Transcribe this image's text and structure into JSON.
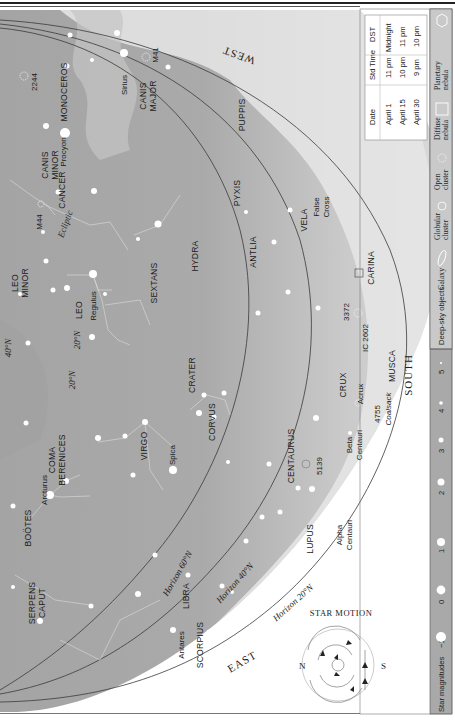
{
  "chart": {
    "title_motion": "STAR MOTION",
    "directions": {
      "west": "WEST",
      "east": "EAST",
      "south": "SOUTH",
      "n": "N",
      "s": "S"
    },
    "horizons": [
      "Horizon 60°N",
      "Horizon 40°N",
      "Horizon 20°N"
    ],
    "ecliptic": "Ecliptic",
    "latitudes": [
      "40°N",
      "20°N",
      "20°N"
    ],
    "constellations": [
      "MONOCEROS",
      "CANIS MINOR",
      "CANIS MAJOR",
      "PUPPIS",
      "CANCER",
      "PYXIS",
      "VELA",
      "LEO MINOR",
      "LEO",
      "SEXTANS",
      "HYDRA",
      "ANTLIA",
      "CARINA",
      "CRATER",
      "CORVUS",
      "CRUX",
      "MUSCA",
      "COMA BERENICES",
      "VIRGO",
      "CENTAURUS",
      "BOÖTES",
      "LUPUS",
      "SERPENS CAPUT",
      "LIBRA",
      "SCORPIUS"
    ],
    "stars": [
      "Sirius",
      "Procyon",
      "Regulus",
      "Arcturus",
      "Spica",
      "Acrux",
      "Beta Centauri",
      "Alpha Centauri",
      "Antares"
    ],
    "objects": [
      "2244",
      "M41",
      "M44",
      "3372",
      "IC 2602",
      "4755",
      "5139"
    ],
    "notes": [
      "False Cross",
      "Coalsack"
    ]
  },
  "legend": {
    "time_table": {
      "headers": [
        "Date",
        "Std Time",
        "DST"
      ],
      "rows": [
        [
          "April 1",
          "11 pm",
          "Midnight"
        ],
        [
          "April 15",
          "10 pm",
          "11 pm"
        ],
        [
          "April 30",
          "9 pm",
          "10 pm"
        ]
      ]
    },
    "magnitudes_label": "Star magnitudes",
    "magnitudes": [
      "−1",
      "0",
      "1",
      "2",
      "3",
      "4",
      "5"
    ],
    "deep_sky_label": "Deep-sky objects",
    "deep_sky": [
      {
        "label": "Galaxy",
        "icon": "galaxy-icon"
      },
      {
        "label": "Globular cluster",
        "icon": "globular-cluster-icon"
      },
      {
        "label": "Open cluster",
        "icon": "open-cluster-icon"
      },
      {
        "label": "Diffuse nebula",
        "icon": "diffuse-nebula-icon"
      },
      {
        "label": "Planetary nebula",
        "icon": "planetary-nebula-icon"
      }
    ]
  },
  "colors": {
    "sky_dark": "#9d9d9d",
    "sky_mid": "#b9b9b9",
    "sky_light": "#d9d9d9",
    "milky_way": "#ececec",
    "legend_bg": "#a9a9a9",
    "line": "#3a3a3a"
  }
}
